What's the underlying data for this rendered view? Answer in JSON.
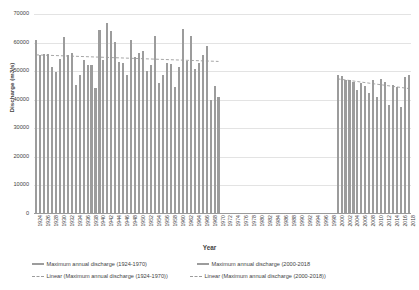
{
  "chart_data": {
    "type": "bar",
    "title": "",
    "xlabel": "Year",
    "ylabel": "Discharge (m3/s)",
    "ylim": [
      0,
      70000
    ],
    "ytick_labels": [
      "70000",
      "60000",
      "50000",
      "40000",
      "30000",
      "20000",
      "10000",
      "0"
    ],
    "ytick_values": [
      70000,
      60000,
      50000,
      40000,
      30000,
      20000,
      10000,
      0
    ],
    "grid": "horizontal",
    "legend_position": "bottom",
    "x_start": 1924,
    "x_end": 2018,
    "xtick_labels": [
      "1924",
      "1926",
      "1928",
      "1930",
      "1932",
      "1934",
      "1936",
      "1938",
      "1940",
      "1942",
      "1944",
      "1946",
      "1948",
      "1950",
      "1952",
      "1954",
      "1956",
      "1958",
      "1960",
      "1962",
      "1964",
      "1966",
      "1968",
      "1970",
      "1972",
      "1974",
      "1976",
      "1978",
      "1980",
      "1982",
      "1984",
      "1986",
      "1988",
      "1990",
      "1992",
      "1994",
      "1996",
      "1998",
      "2000",
      "2002",
      "2004",
      "2006",
      "2008",
      "2010",
      "2012",
      "2014",
      "2016",
      "2018"
    ],
    "series": [
      {
        "name": "Maximum annual discharge (1924-1970)",
        "color": "#9c9c9c",
        "kind": "bar",
        "x": [
          1924,
          1925,
          1926,
          1927,
          1928,
          1929,
          1930,
          1931,
          1932,
          1933,
          1934,
          1935,
          1936,
          1937,
          1938,
          1939,
          1940,
          1941,
          1942,
          1943,
          1944,
          1945,
          1946,
          1947,
          1948,
          1949,
          1950,
          1951,
          1952,
          1953,
          1954,
          1955,
          1956,
          1957,
          1958,
          1959,
          1960,
          1961,
          1962,
          1963,
          1964,
          1965,
          1966,
          1967,
          1968,
          1969,
          1970
        ],
        "values": [
          61000,
          55800,
          55900,
          56000,
          51600,
          49800,
          54400,
          62100,
          55600,
          56500,
          45000,
          48800,
          53800,
          52100,
          52000,
          44200,
          64500,
          53800,
          66900,
          64200,
          60300,
          53200,
          52900,
          48500,
          61000,
          54800,
          56300,
          56900,
          50200,
          52100,
          62200,
          45700,
          48800,
          52900,
          52600,
          44300,
          51400,
          64600,
          53400,
          62400,
          50700,
          53000,
          55800,
          58900,
          40000,
          44900,
          40900
        ]
      },
      {
        "name": "Maximum annual discharge (2000-2018",
        "color": "#9c9c9c",
        "kind": "bar",
        "x": [
          2000,
          2001,
          2002,
          2003,
          2004,
          2005,
          2006,
          2007,
          2008,
          2009,
          2010,
          2011,
          2012,
          2013,
          2014,
          2015,
          2016,
          2017,
          2018
        ],
        "values": [
          48600,
          48200,
          47000,
          46900,
          46200,
          43300,
          45900,
          44800,
          42300,
          47000,
          41000,
          47100,
          46200,
          38100,
          45300,
          44600,
          37400,
          47800,
          48700
        ]
      },
      {
        "name": "Linear (Maximum annual discharge (1924-1970))",
        "color": "#9c9c9c",
        "kind": "trend-dashed",
        "x": [
          1924,
          1970
        ],
        "values": [
          55700,
          53400
        ]
      },
      {
        "name": "Linear (Maximum annual discharge (2000-2018))",
        "color": "#9c9c9c",
        "kind": "trend-dashed",
        "x": [
          2000,
          2018
        ],
        "values": [
          47300,
          43900
        ]
      }
    ]
  },
  "legend": {
    "items": [
      {
        "label": "Maximum annual discharge (1924-1970)",
        "marker": "bar"
      },
      {
        "label": "Maximum annual discharge (2000-2018",
        "marker": "bar"
      },
      {
        "label": "Linear (Maximum annual discharge (1924-1970))",
        "marker": "dash"
      },
      {
        "label": "Linear (Maximum annual discharge (2000-2018))",
        "marker": "dash"
      }
    ]
  }
}
